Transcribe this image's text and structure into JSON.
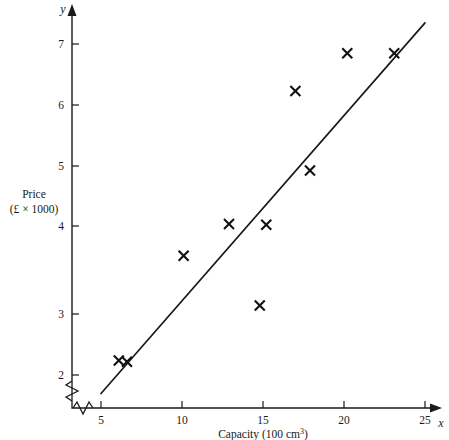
{
  "chart_data": {
    "type": "scatter",
    "title": "",
    "xlabel": "Capacity (100 cm³)",
    "xlabel_main": "Capacity (100 cm",
    "xlabel_sup": "3",
    "xlabel_tail": ")",
    "ylabel_line1": "Price",
    "ylabel_line2": "(£ × 1000)",
    "x_axis_variable": "x",
    "y_axis_variable": "y",
    "xlim": [
      4.2,
      25.9
    ],
    "ylim": [
      1.55,
      7.45
    ],
    "x_ticks": [
      5,
      10,
      15,
      20,
      25
    ],
    "x_tick_labels": [
      "5",
      "10",
      "15",
      "20",
      "25"
    ],
    "y_ticks": [
      2,
      3,
      4,
      5,
      6,
      7
    ],
    "y_tick_labels": [
      "2",
      "3",
      "4",
      "5",
      "6",
      "7"
    ],
    "grid": false,
    "legend": "none",
    "axis_break_x": true,
    "axis_break_y": true,
    "marker_style": "x-cross",
    "points": [
      {
        "x": 6.1,
        "y": 2.22
      },
      {
        "x": 6.6,
        "y": 2.2
      },
      {
        "x": 10.1,
        "y": 3.8
      },
      {
        "x": 12.9,
        "y": 4.28
      },
      {
        "x": 14.8,
        "y": 3.05
      },
      {
        "x": 15.2,
        "y": 4.27
      },
      {
        "x": 17.0,
        "y": 6.29
      },
      {
        "x": 17.9,
        "y": 5.09
      },
      {
        "x": 20.2,
        "y": 6.86
      },
      {
        "x": 23.1,
        "y": 6.86
      }
    ],
    "series": [
      {
        "name": "Price vs Capacity",
        "x": [
          6.1,
          6.6,
          10.1,
          12.9,
          14.8,
          15.2,
          17.0,
          17.9,
          20.2,
          23.1
        ],
        "values": [
          2.22,
          2.2,
          3.8,
          4.28,
          3.05,
          4.27,
          6.29,
          5.09,
          6.86,
          6.86
        ]
      }
    ],
    "regression_line": {
      "name": "line of best fit",
      "x_start": 5.0,
      "y_start": 1.72,
      "x_end": 25.0,
      "y_end": 7.32
    }
  }
}
